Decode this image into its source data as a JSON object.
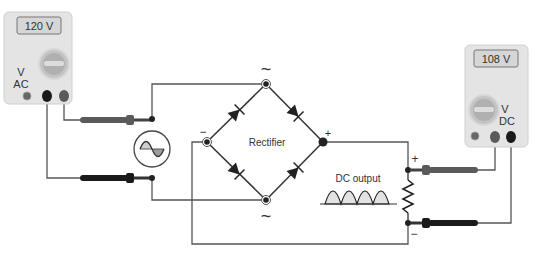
{
  "diagram": {
    "rectifier_label": "Rectifier",
    "dc_output_label": "DC output",
    "ac_symbol_top": "~",
    "ac_symbol_bottom": "~",
    "bridge_minus": "−",
    "bridge_plus": "+",
    "load_plus": "+",
    "load_minus": "−"
  },
  "meters": {
    "ac_meter": {
      "reading": "120 V",
      "mode_line1": "V",
      "mode_line2": "AC"
    },
    "dc_meter": {
      "reading": "108 V",
      "mode_line1": "V",
      "mode_line2": "DC"
    }
  },
  "colors": {
    "wire": "#555555",
    "meter_body": "#e3e3e3",
    "display": "#d4d4d4",
    "probe_red": "#5a5a5a",
    "probe_black": "#1a1a1a",
    "node": "#222222"
  }
}
